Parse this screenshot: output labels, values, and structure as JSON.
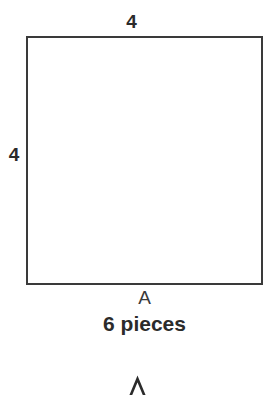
{
  "figure": {
    "shape": "square",
    "top_dimension": "4",
    "left_dimension": "4",
    "vertex_label": "A",
    "caption": "6 pieces",
    "border_color": "#3a3a3a",
    "fill_color": "#ffffff",
    "text_color": "#2b2b2b"
  },
  "bottom_marker": {
    "icon": "chevron-up-icon"
  },
  "page": {
    "background": "#ffffff"
  }
}
